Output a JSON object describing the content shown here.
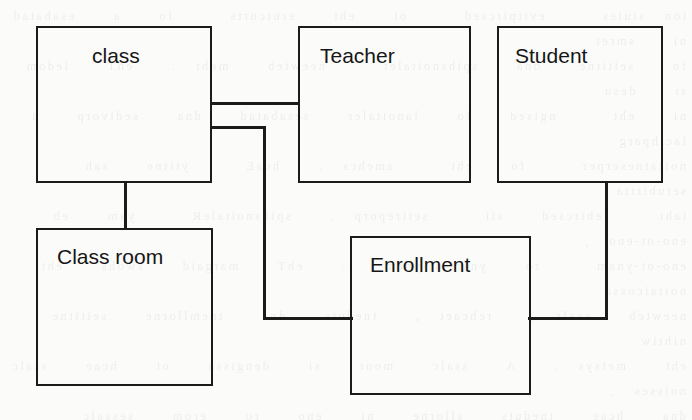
{
  "diagram": {
    "background_color": "#fbfbf9",
    "line_color": "#1b1b1b",
    "text_color": "#161616",
    "entities": [
      {
        "id": "class",
        "label": "class",
        "x": 36,
        "y": 26,
        "w": 176,
        "h": 157,
        "label_x": 92,
        "label_y": 45
      },
      {
        "id": "teacher",
        "label": "Teacher",
        "x": 298,
        "y": 26,
        "w": 173,
        "h": 157,
        "label_x": 320,
        "label_y": 45
      },
      {
        "id": "student",
        "label": "Student",
        "x": 497,
        "y": 26,
        "w": 166,
        "h": 157,
        "label_x": 515,
        "label_y": 45
      },
      {
        "id": "class-room",
        "label": "Class room",
        "x": 36,
        "y": 228,
        "w": 177,
        "h": 158,
        "label_x": 57,
        "label_y": 246
      },
      {
        "id": "enrollment",
        "label": "Enrollment",
        "x": 350,
        "y": 236,
        "w": 181,
        "h": 159,
        "label_x": 370,
        "label_y": 254
      }
    ],
    "connectors": [
      {
        "id": "class-teacher",
        "from": "class",
        "to": "teacher",
        "segments": [
          {
            "orient": "h",
            "x": 210,
            "y": 102,
            "len": 90
          }
        ]
      },
      {
        "id": "class-enrollment",
        "from": "class",
        "to": "enrollment",
        "segments": [
          {
            "orient": "h",
            "x": 210,
            "y": 126,
            "len": 55
          },
          {
            "orient": "v",
            "x": 263,
            "y": 126,
            "len": 194
          },
          {
            "orient": "h",
            "x": 263,
            "y": 317,
            "len": 90
          }
        ]
      },
      {
        "id": "class-classroom",
        "from": "class",
        "to": "class-room",
        "segments": [
          {
            "orient": "v",
            "x": 124,
            "y": 181,
            "len": 49
          }
        ]
      },
      {
        "id": "student-enrollment",
        "from": "student",
        "to": "enrollment",
        "segments": [
          {
            "orient": "v",
            "x": 605,
            "y": 181,
            "len": 139
          },
          {
            "orient": "h",
            "x": 528,
            "y": 317,
            "len": 80
          }
        ]
      }
    ]
  },
  "paper": {
    "showthrough_text": "ton stutes   evitpircsed   ot  eht  erutcurts   fo  a  esabatad   ni  smret\nfo  seititne  dna  spihsnoitaler   neewteb  meht .  ehT  ledom  si  desu\nni  eht   ngised  fo  lanoitaler  sesabatad  dna  sedivorp  a  lacihparg\nnoitatneserper   fo  eht   amehcs .  hcaE   ytitne  sah  setubirtta\ntaht   ebircsed  sti   seitreporp .  spihsnoitaleR   yam  eb  eno-ot-eno ,\neno-ot-ynam   ro  ynam-ot-ynam  .  ehT  margaid  swohs  eht  noitaicossa\nneewteb  ssalc ,  rehcaet ,  tneduts  dna  tnemllorne  seititne   nihtiw\neht  metsys .  A  ssalc  moor  si  dengissa  ot  hcae  ssalc  noisses ,\ndna  hcae  tneduts  sllorne  ni  eno  ro  erom  sessalc  hguorht  eht\ntnemllorne  noitaicossa  elbat .  sihT  si  eht  lacinonac  elpmaxe  desu\nni  tsom  esabatad  skoobtxet  rof  gninialpxe  ynam-ot-ynam  spihsnoitaler\ndna  eht  deen  rof  a  noitcnuj  ro  egdirb  elbat  ni  eht  amehcs\nngised  ssecorp .  ehT  seititne  era  nwohs  sa  selgnatcer  detcennoc\nyb  senil  gnitneserper  rieht  lautum  spihsnoitaler  ni  eht  ledom .\nnoitaziramron  sevomer  ycnadnuder  morf  eht  elbat  erutcurts  yltaerg ."
  }
}
